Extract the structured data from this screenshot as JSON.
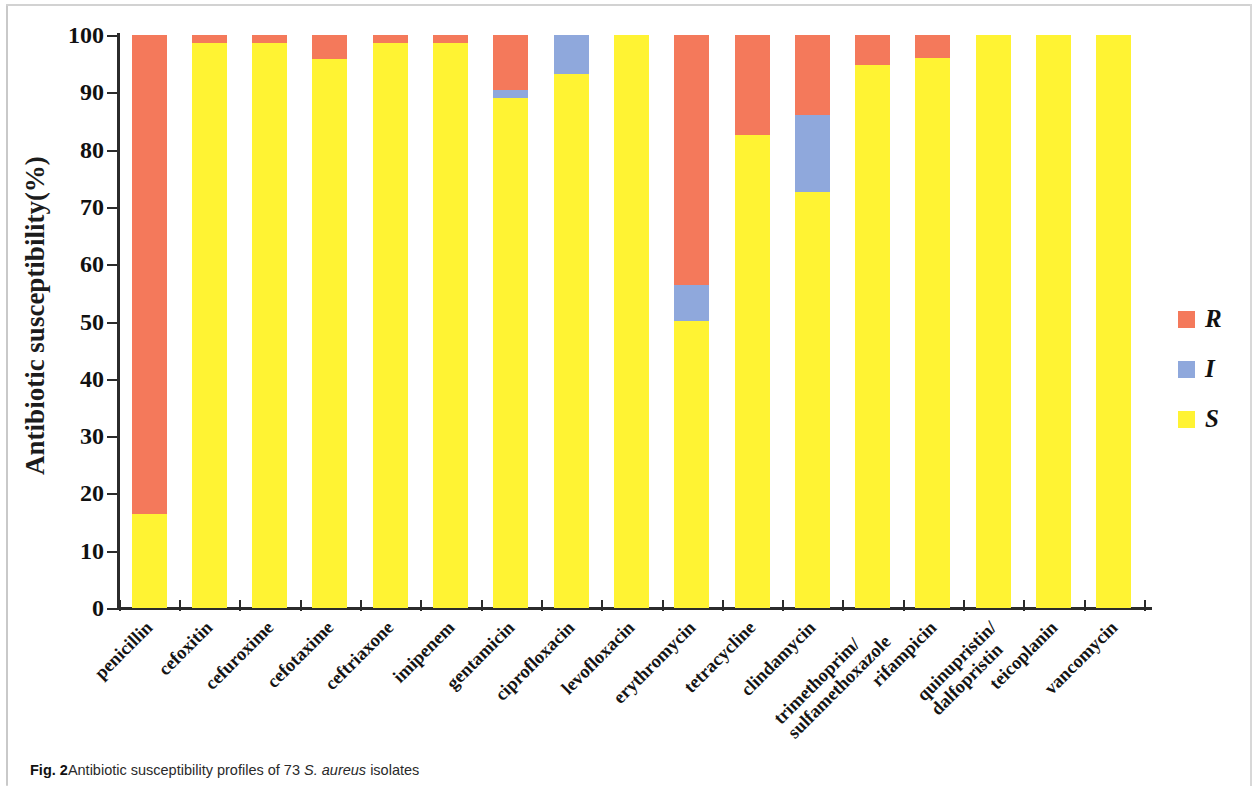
{
  "caption": {
    "figure_number": "Fig. 2",
    "text_before": "Antibiotic susceptibility profiles of 73 ",
    "italic_text": "S. aureus",
    "text_after": " isolates"
  },
  "legend": {
    "position": "right",
    "items": [
      {
        "label": "R",
        "color": "#f4795b",
        "name": "Resistant"
      },
      {
        "label": "I",
        "color": "#8fa8dc",
        "name": "Intermediate"
      },
      {
        "label": "S",
        "color": "#fff333",
        "name": "Susceptible"
      }
    ]
  },
  "axis": {
    "y_title": "Antibiotic susceptibility(%)",
    "y_ticks": [
      "0",
      "10",
      "20",
      "30",
      "40",
      "50",
      "60",
      "70",
      "80",
      "90",
      "100"
    ]
  },
  "chart_data": {
    "type": "bar",
    "stacked": true,
    "title": "Antibiotic susceptibility profiles of 73 S. aureus isolates",
    "xlabel": "",
    "ylabel": "Antibiotic susceptibility(%)",
    "ylim": [
      0,
      100
    ],
    "ytick_step": 10,
    "grid": false,
    "legend_position": "right",
    "categories": [
      "penicillin",
      "cefoxitin",
      "cefuroxime",
      "cefotaxime",
      "ceftriaxone",
      "imipenem",
      "gentamicin",
      "ciprofloxacin",
      "levofloxacin",
      "erythromycin",
      "tetracycline",
      "clindamycin",
      "trimethoprim/ sulfamethoxazole",
      "rifampicin",
      "quinupristin/ dalfopristin",
      "teicoplanin",
      "vancomycin"
    ],
    "category_lines": [
      [
        "penicillin"
      ],
      [
        "cefoxitin"
      ],
      [
        "cefuroxime"
      ],
      [
        "cefotaxime"
      ],
      [
        "ceftriaxone"
      ],
      [
        "imipenem"
      ],
      [
        "gentamicin"
      ],
      [
        "ciprofloxacin"
      ],
      [
        "levofloxacin"
      ],
      [
        "erythromycin"
      ],
      [
        "tetracycline"
      ],
      [
        "clindamycin"
      ],
      [
        "trimethoprim/",
        "sulfamethoxazole"
      ],
      [
        "rifampicin"
      ],
      [
        "quinupristin/",
        "dalfopristin"
      ],
      [
        "teicoplanin"
      ],
      [
        "vancomycin"
      ]
    ],
    "series": [
      {
        "name": "S",
        "color": "#fff333",
        "values": [
          16.4,
          98.6,
          98.6,
          95.9,
          98.6,
          98.6,
          89.0,
          93.2,
          100.0,
          50.1,
          82.5,
          72.6,
          94.8,
          96.0,
          100.0,
          100.0,
          100.0
        ]
      },
      {
        "name": "I",
        "color": "#8fa8dc",
        "values": [
          0.0,
          0.0,
          0.0,
          0.0,
          0.0,
          0.0,
          1.4,
          6.8,
          0.0,
          6.3,
          0.0,
          13.4,
          0.0,
          0.0,
          0.0,
          0.0,
          0.0
        ]
      },
      {
        "name": "R",
        "color": "#f4795b",
        "values": [
          83.6,
          1.4,
          1.4,
          4.1,
          1.4,
          1.4,
          9.6,
          0.0,
          0.0,
          43.6,
          17.5,
          14.0,
          5.2,
          4.0,
          0.0,
          0.0,
          0.0
        ]
      }
    ]
  }
}
